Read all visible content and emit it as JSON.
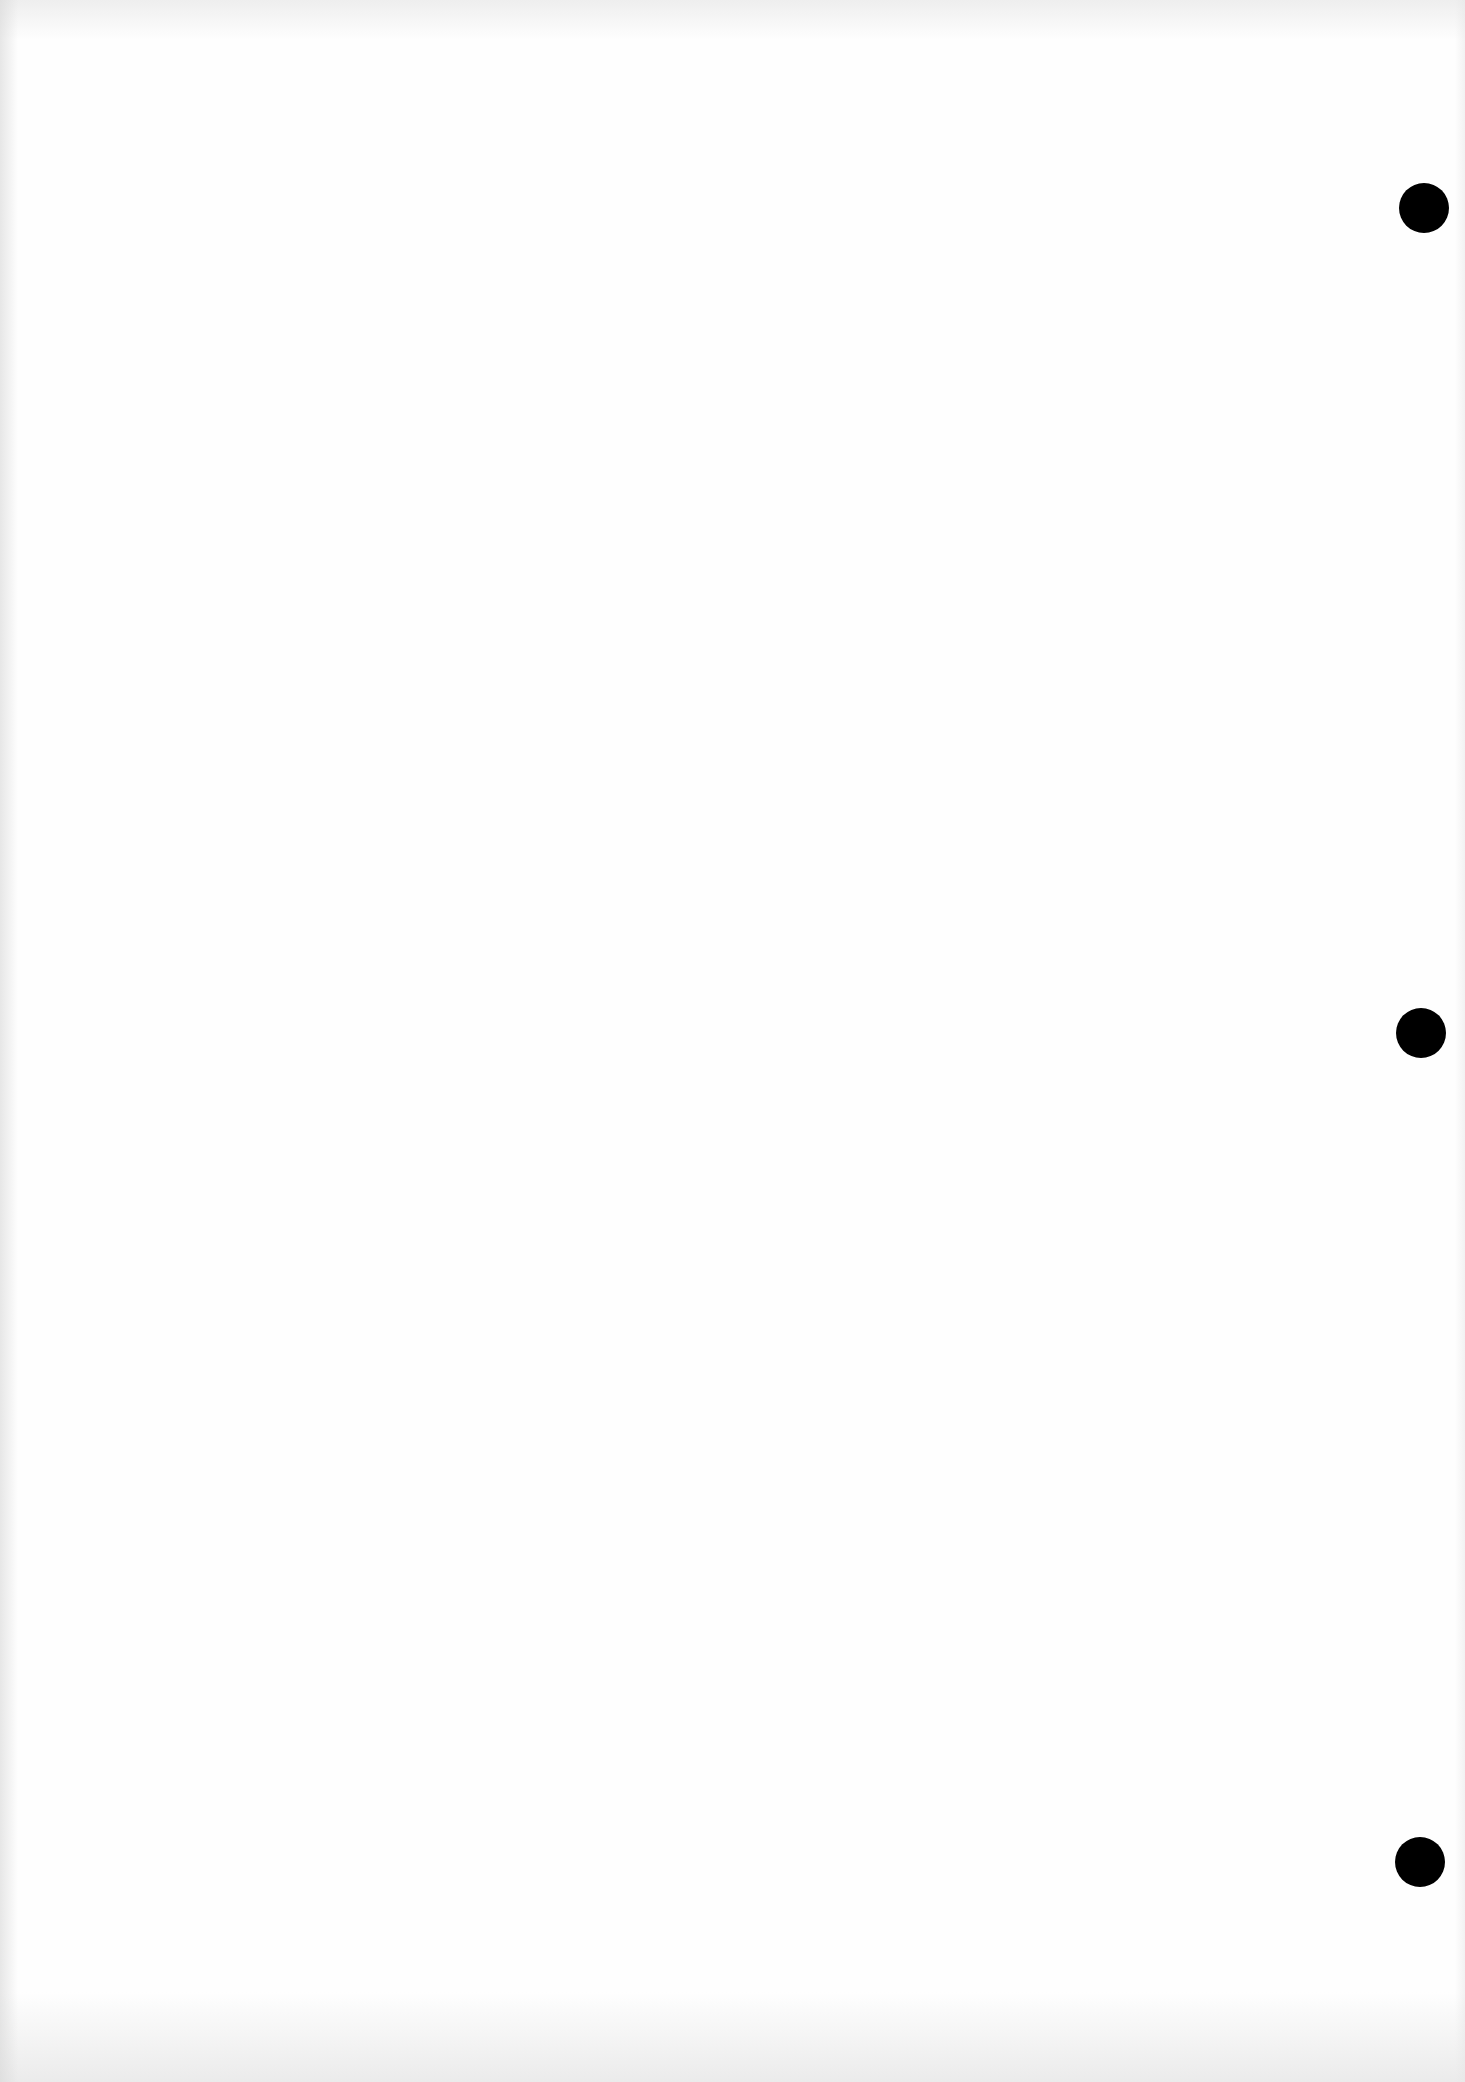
{
  "page": {
    "type": "blank-sheet",
    "background_color": "#fefefe",
    "text": ""
  },
  "punch_holes": [
    {
      "x": 1424,
      "y": 208,
      "diameter": 50,
      "color": "#000000"
    },
    {
      "x": 1421,
      "y": 1033,
      "diameter": 50,
      "color": "#000000"
    },
    {
      "x": 1420,
      "y": 1862,
      "diameter": 50,
      "color": "#000000"
    }
  ]
}
